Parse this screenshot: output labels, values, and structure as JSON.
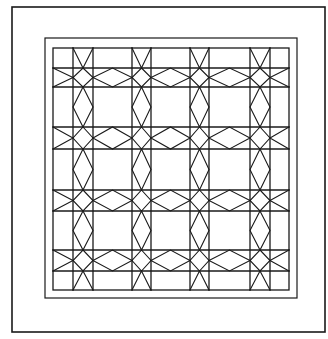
{
  "figure": {
    "type": "quilt-pattern-line-drawing",
    "width": 328,
    "height": 339,
    "stroke_color": "#1a1a1a",
    "background": "#ffffff",
    "outer_frame": {
      "x1": 12,
      "y1": 7,
      "x2": 325,
      "y2": 332,
      "stroke_width": 1.6
    },
    "inner_border": {
      "x1": 45,
      "y1": 38,
      "x2": 297,
      "y2": 298,
      "stroke_width": 1.2
    },
    "grid": {
      "x1": 53,
      "y1": 48,
      "x2": 289,
      "y2": 290,
      "stroke_width": 1.3,
      "vertical_strips": [
        [
          73,
          93
        ],
        [
          132,
          151
        ],
        [
          190,
          209
        ],
        [
          250,
          270
        ]
      ],
      "horizontal_strips": [
        [
          68,
          87
        ],
        [
          127,
          149
        ],
        [
          190,
          211
        ],
        [
          250,
          271
        ]
      ]
    },
    "motifs": {
      "intersection": "star-diamond",
      "strip_segment": "elongated-diamond",
      "rim_segment": "converging-chevron"
    }
  }
}
